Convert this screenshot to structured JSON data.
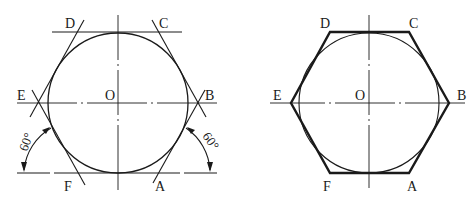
{
  "figure_left": {
    "title": "Construction of regular hexagon with circumscribed tangents (30°-60° set square)",
    "center_label": "O",
    "vertex_labels": {
      "A": "A",
      "B": "B",
      "C": "C",
      "D": "D",
      "E": "E",
      "F": "F"
    },
    "angle_left": "60°",
    "angle_right": "60°"
  },
  "figure_right": {
    "title": "Completed regular hexagon circumscribed about circle",
    "center_label": "O",
    "vertex_labels": {
      "A": "A",
      "B": "B",
      "C": "C",
      "D": "D",
      "E": "E",
      "F": "F"
    }
  },
  "colors": {
    "line": "#1a1a1a",
    "background": "#ffffff"
  }
}
